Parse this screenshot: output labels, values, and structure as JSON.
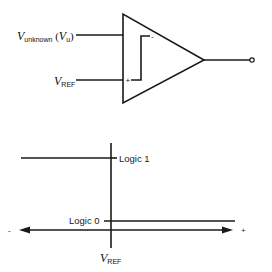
{
  "comparator": {
    "input_unknown": {
      "symbol": "V",
      "subscript": "unknown",
      "paren_open": " (",
      "paren_symbol": "V",
      "paren_subscript": "u",
      "paren_close": ")"
    },
    "input_ref": {
      "symbol": "V",
      "subscript": "REF"
    },
    "minus_sign": "-",
    "plus_sign": "+"
  },
  "transfer_graph": {
    "logic_high_label": "Logic 1",
    "logic_low_label": "Logic 0",
    "axis_negative_label": "-",
    "axis_positive_label": "+",
    "threshold_label": {
      "symbol": "V",
      "subscript": "REF"
    }
  },
  "colors": {
    "stroke": "#1a1a1a",
    "background": "#ffffff"
  }
}
